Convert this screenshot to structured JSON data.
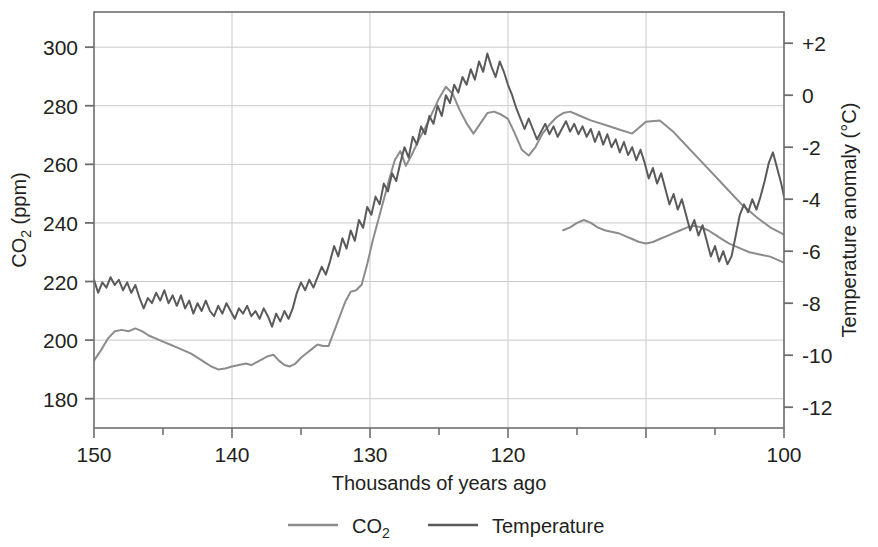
{
  "chart_data": {
    "type": "line",
    "title": "",
    "subtitle": "",
    "xlabel": "Thousands of years ago",
    "ylabel": "CO₂ (ppm)",
    "y2label": "Temperature anomaly (°C)",
    "grid": true,
    "legend_position": "bottom",
    "xlim": [
      150,
      100
    ],
    "x_reversed": true,
    "xticks_major": [
      150,
      140,
      130,
      120,
      110,
      100
    ],
    "xtick_labels": [
      "150",
      "140",
      "130",
      "120",
      "",
      "100"
    ],
    "xticks_minor_step": 5,
    "ylim": [
      170,
      312
    ],
    "yticks": [
      180,
      200,
      220,
      240,
      260,
      280,
      300
    ],
    "ytick_labels": [
      "180",
      "200",
      "220",
      "240",
      "260",
      "280",
      "300"
    ],
    "y2lim": [
      -12.8,
      3.2
    ],
    "y2ticks": [
      2,
      0,
      -2,
      -4,
      -6,
      -8,
      -10,
      -12
    ],
    "y2tick_labels": [
      "+2",
      "0",
      "-2",
      "-4",
      "-6",
      "-8",
      "-10",
      "-12"
    ],
    "colors": {
      "co2": "#8c8c8c",
      "temperature": "#5a5a5a",
      "axis": "#6d6e71",
      "grid": "#c9c9c9",
      "text": "#231f20"
    },
    "series": [
      {
        "name": "CO₂",
        "axis": "left",
        "units": "ppm",
        "color": "#8c8c8c",
        "x": [
          150.0,
          149.5,
          149.0,
          148.5,
          148.0,
          147.5,
          147.0,
          146.5,
          146.0,
          145.5,
          145.0,
          144.5,
          144.0,
          143.5,
          143.0,
          142.5,
          142.0,
          141.5,
          141.0,
          140.5,
          140.0,
          139.5,
          139.0,
          138.6,
          138.2,
          137.8,
          137.4,
          137.0,
          136.6,
          136.2,
          135.8,
          135.4,
          135.0,
          134.6,
          134.2,
          133.8,
          133.4,
          133.0,
          132.6,
          132.2,
          131.8,
          131.4,
          131.0,
          130.6,
          130.2,
          129.8,
          129.4,
          129.0,
          128.6,
          128.2,
          127.8,
          127.4,
          127.0,
          126.5,
          126.0,
          125.5,
          125.0,
          124.5,
          124.0,
          123.5,
          123.0,
          122.5,
          122.0,
          121.5,
          121.0,
          120.5,
          120.0,
          119.5,
          119.0,
          118.5,
          118.0,
          117.5,
          117.0,
          116.5,
          116.0,
          115.5,
          115.0,
          114.5,
          114.0,
          113.0,
          112.0,
          111.0,
          110.0,
          109.0,
          108.0,
          107.0,
          106.0,
          105.0,
          104.0,
          103.0,
          102.0,
          101.0,
          100.0
        ],
        "y": [
          193.0,
          196.5,
          200.5,
          203.0,
          203.5,
          203.0,
          204.0,
          203.0,
          201.5,
          200.5,
          199.5,
          198.5,
          197.5,
          196.5,
          195.5,
          194.0,
          192.5,
          191.0,
          190.0,
          190.3,
          191.0,
          191.5,
          192.0,
          191.5,
          192.5,
          193.5,
          194.5,
          195.0,
          193.0,
          191.5,
          191.0,
          192.0,
          194.0,
          195.5,
          197.0,
          198.5,
          198.0,
          198.0,
          203.0,
          208.0,
          213.0,
          216.5,
          217.0,
          219.0,
          226.0,
          234.0,
          241.0,
          248.0,
          255.0,
          261.5,
          264.5,
          259.5,
          263.0,
          268.0,
          272.5,
          277.5,
          282.5,
          286.5,
          284.0,
          278.5,
          274.0,
          270.5,
          274.0,
          277.5,
          278.0,
          277.0,
          275.5,
          270.5,
          265.0,
          263.0,
          266.0,
          270.5,
          273.5,
          276.0,
          277.5,
          278.0,
          277.0,
          276.0,
          275.0,
          273.5,
          272.0,
          270.5,
          274.5,
          275.0,
          271.0,
          266.0,
          261.0,
          256.0,
          251.0,
          246.0,
          242.0,
          238.5,
          236.0
        ]
      },
      {
        "name": "CO₂ (later segment)",
        "axis": "left",
        "units": "ppm",
        "color": "#8c8c8c",
        "x": [
          116.0,
          115.5,
          115.0,
          114.5,
          114.0,
          113.5,
          113.0,
          112.5,
          112.0,
          111.5,
          111.0,
          110.5,
          110.0,
          109.5,
          109.0,
          108.5,
          108.0,
          107.5,
          107.0,
          106.5,
          106.0,
          105.5,
          105.0,
          104.5,
          104.0,
          103.5,
          103.0,
          102.5,
          102.0,
          101.5,
          101.0,
          100.5,
          100.0
        ],
        "y": [
          237.5,
          238.5,
          240.0,
          241.0,
          240.0,
          238.5,
          237.5,
          237.0,
          236.5,
          235.5,
          234.5,
          233.5,
          233.0,
          233.5,
          234.5,
          235.5,
          236.5,
          237.5,
          238.5,
          239.0,
          238.5,
          237.5,
          236.0,
          234.5,
          233.0,
          232.0,
          231.0,
          230.0,
          229.5,
          229.0,
          228.5,
          227.5,
          226.5
        ]
      },
      {
        "name": "Temperature",
        "axis": "right",
        "units": "°C",
        "color": "#5a5a5a",
        "x": [
          150.0,
          149.7,
          149.4,
          149.1,
          148.8,
          148.5,
          148.2,
          147.9,
          147.6,
          147.3,
          147.0,
          146.7,
          146.4,
          146.1,
          145.8,
          145.5,
          145.2,
          144.9,
          144.6,
          144.3,
          144.0,
          143.7,
          143.4,
          143.1,
          142.8,
          142.5,
          142.2,
          141.9,
          141.6,
          141.3,
          141.0,
          140.7,
          140.4,
          140.1,
          139.8,
          139.5,
          139.2,
          138.9,
          138.6,
          138.3,
          138.0,
          137.7,
          137.4,
          137.1,
          136.8,
          136.5,
          136.2,
          135.9,
          135.6,
          135.3,
          135.0,
          134.7,
          134.4,
          134.1,
          133.8,
          133.5,
          133.2,
          132.9,
          132.6,
          132.3,
          132.0,
          131.7,
          131.4,
          131.1,
          130.8,
          130.5,
          130.2,
          129.9,
          129.6,
          129.3,
          129.0,
          128.7,
          128.4,
          128.1,
          127.8,
          127.5,
          127.2,
          126.9,
          126.6,
          126.3,
          126.0,
          125.7,
          125.4,
          125.1,
          124.8,
          124.5,
          124.2,
          123.9,
          123.6,
          123.3,
          123.0,
          122.7,
          122.4,
          122.1,
          121.8,
          121.5,
          121.2,
          120.9,
          120.6,
          120.3,
          120.0,
          119.7,
          119.4,
          119.1,
          118.8,
          118.5,
          118.2,
          117.9,
          117.6,
          117.3,
          117.0,
          116.7,
          116.4,
          116.1,
          115.8,
          115.5,
          115.2,
          114.9,
          114.6,
          114.3,
          114.0,
          113.7,
          113.4,
          113.1,
          112.8,
          112.5,
          112.2,
          111.9,
          111.6,
          111.3,
          111.0,
          110.7,
          110.4,
          110.1,
          109.8,
          109.5,
          109.2,
          108.9,
          108.6,
          108.3,
          108.0,
          107.7,
          107.4,
          107.1,
          106.8,
          106.5,
          106.2,
          105.9,
          105.6,
          105.3,
          105.0,
          104.7,
          104.4,
          104.1,
          103.8,
          103.5,
          103.2,
          102.9,
          102.6,
          102.3,
          102.0,
          101.7,
          101.4,
          101.1,
          100.8,
          100.5,
          100.2,
          100.0
        ],
        "y": [
          -7.1,
          -7.6,
          -7.2,
          -7.4,
          -7.0,
          -7.3,
          -7.1,
          -7.5,
          -7.2,
          -7.6,
          -7.3,
          -7.8,
          -8.2,
          -7.8,
          -8.0,
          -7.6,
          -7.9,
          -7.5,
          -8.0,
          -7.7,
          -8.1,
          -7.7,
          -8.2,
          -7.9,
          -8.4,
          -8.0,
          -8.3,
          -7.9,
          -8.3,
          -8.5,
          -8.1,
          -8.4,
          -8.0,
          -8.3,
          -8.6,
          -8.2,
          -8.4,
          -8.1,
          -8.5,
          -8.3,
          -8.6,
          -8.2,
          -8.5,
          -8.9,
          -8.4,
          -8.7,
          -8.3,
          -8.6,
          -8.2,
          -7.6,
          -7.2,
          -7.5,
          -7.1,
          -7.4,
          -7.0,
          -6.6,
          -6.9,
          -6.4,
          -5.8,
          -6.2,
          -5.5,
          -5.9,
          -5.2,
          -5.6,
          -4.8,
          -5.1,
          -4.3,
          -4.6,
          -3.9,
          -4.2,
          -3.4,
          -3.7,
          -3.0,
          -3.3,
          -2.6,
          -2.0,
          -2.4,
          -1.6,
          -1.9,
          -1.2,
          -1.5,
          -0.8,
          -1.1,
          -0.4,
          -0.8,
          0.0,
          -0.3,
          0.4,
          0.1,
          0.7,
          0.4,
          1.0,
          0.6,
          1.3,
          0.9,
          1.6,
          1.1,
          0.7,
          1.3,
          0.9,
          0.4,
          0.0,
          -0.5,
          -0.9,
          -1.3,
          -0.9,
          -1.3,
          -1.7,
          -1.4,
          -1.1,
          -1.5,
          -1.2,
          -1.6,
          -1.3,
          -1.0,
          -1.4,
          -1.1,
          -1.5,
          -1.2,
          -1.6,
          -1.3,
          -1.8,
          -1.4,
          -1.9,
          -1.5,
          -2.0,
          -1.7,
          -2.2,
          -1.8,
          -2.3,
          -2.0,
          -2.5,
          -2.1,
          -2.6,
          -3.2,
          -2.8,
          -3.4,
          -3.0,
          -3.6,
          -4.2,
          -3.8,
          -4.4,
          -4.0,
          -4.6,
          -5.2,
          -4.8,
          -5.4,
          -5.0,
          -5.6,
          -6.2,
          -5.8,
          -6.4,
          -6.0,
          -6.5,
          -6.2,
          -5.4,
          -4.6,
          -4.2,
          -4.5,
          -4.0,
          -4.4,
          -3.9,
          -3.3,
          -2.6,
          -2.2,
          -2.8,
          -3.4,
          -3.9
        ]
      }
    ],
    "legend": [
      {
        "label": "CO₂",
        "color": "#8c8c8c"
      },
      {
        "label": "Temperature",
        "color": "#5a5a5a"
      }
    ]
  },
  "axes": {
    "x_title": "Thousands of years ago",
    "y_left_title_main": "CO",
    "y_left_title_sub": "2",
    "y_left_title_tail": " (ppm)",
    "y_right_title": "Temperature anomaly (°C)"
  },
  "legend": {
    "co2_label_main": "CO",
    "co2_label_sub": "2",
    "temperature_label": "Temperature"
  }
}
